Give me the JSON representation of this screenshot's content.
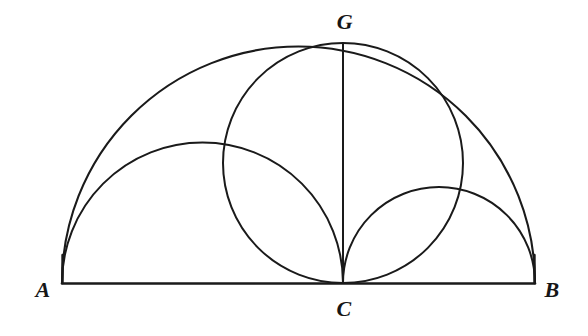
{
  "figure": {
    "background_color": "#ffffff",
    "stroke_color": "#1a1a1a",
    "labels": [
      {
        "id": "A",
        "text": "A",
        "x": 43,
        "y": 290
      },
      {
        "id": "B",
        "text": "B",
        "x": 552,
        "y": 290
      },
      {
        "id": "C",
        "text": "C",
        "x": 344,
        "y": 309
      },
      {
        "id": "G",
        "text": "G",
        "x": 345,
        "y": 22
      }
    ],
    "points": {
      "A": {
        "x": 62,
        "y": 283
      },
      "B": {
        "x": 535,
        "y": 283
      },
      "C": {
        "x": 343,
        "y": 283
      },
      "G": {
        "x": 343,
        "y": 43
      }
    },
    "shapes": {
      "baseline_AB": {
        "type": "segment",
        "x1": 62,
        "y1": 283,
        "x2": 535,
        "y2": 283
      },
      "segment_GC": {
        "type": "segment",
        "x1": 343,
        "y1": 43,
        "x2": 343,
        "y2": 283
      },
      "semicircle_AB": {
        "type": "semicircle",
        "cx": 298.5,
        "cy": 283,
        "r": 236.5
      },
      "semicircle_AC": {
        "type": "semicircle",
        "cx": 202.5,
        "cy": 283,
        "r": 140.5
      },
      "semicircle_CB": {
        "type": "semicircle",
        "cx": 439,
        "cy": 283,
        "r": 96
      },
      "circle_GC_diameter": {
        "type": "circle",
        "cx": 343,
        "cy": 163,
        "r": 120
      }
    }
  }
}
